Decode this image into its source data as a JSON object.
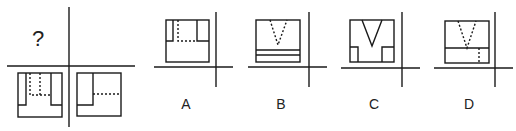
{
  "question": {
    "unknown_mark": "?",
    "given_views": [
      "front-view-bottom-left",
      "side-view-bottom-right"
    ]
  },
  "options": [
    {
      "label": "A"
    },
    {
      "label": "B"
    },
    {
      "label": "C"
    },
    {
      "label": "D"
    }
  ]
}
